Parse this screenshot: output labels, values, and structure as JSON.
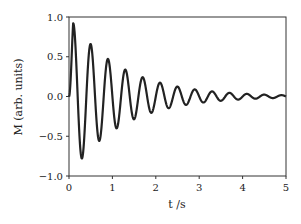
{
  "chart_data": {
    "type": "line",
    "title": "",
    "xlabel": "t /s",
    "ylabel": "M (arb. units)",
    "xlim": [
      0,
      5
    ],
    "ylim": [
      -1.0,
      1.0
    ],
    "xticks": [
      "0",
      "1",
      "2",
      "3",
      "4",
      "5"
    ],
    "yticks": [
      "−1.0",
      "−0.5",
      "0.0",
      "0.5",
      "1.0"
    ],
    "grid": false,
    "legend": null,
    "series": [
      {
        "name": "M(t)",
        "color": "#222222",
        "model": "damped cosine",
        "amplitude": 1.0,
        "period_s": 0.4,
        "decay_time_s": 1.2,
        "phase_shift_s": 0.1,
        "peaks": [
          [
            0.1,
            0.9
          ],
          [
            0.3,
            -0.75
          ],
          [
            0.5,
            0.6
          ],
          [
            0.7,
            -0.5
          ],
          [
            0.9,
            0.4
          ],
          [
            1.1,
            -0.33
          ],
          [
            1.3,
            0.28
          ],
          [
            1.7,
            0.2
          ],
          [
            2.1,
            0.13
          ],
          [
            2.5,
            0.09
          ],
          [
            3.0,
            0.05
          ],
          [
            4.0,
            0.02
          ],
          [
            5.0,
            0.0
          ]
        ]
      }
    ]
  }
}
